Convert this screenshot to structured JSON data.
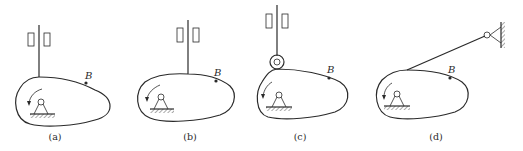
{
  "figure": {
    "panels": [
      {
        "id": "a",
        "caption": "(a)",
        "point_label": "B",
        "follower": "knife-edge translating"
      },
      {
        "id": "b",
        "caption": "(b)",
        "point_label": "B",
        "follower": "knife-edge translating (offset)"
      },
      {
        "id": "c",
        "caption": "(c)",
        "point_label": "B",
        "follower": "roller translating"
      },
      {
        "id": "d",
        "caption": "(d)",
        "point_label": "B",
        "follower": "knife-edge oscillating"
      }
    ],
    "colors": {
      "ink": "#2a2a2a",
      "background": "#ffffff"
    }
  }
}
